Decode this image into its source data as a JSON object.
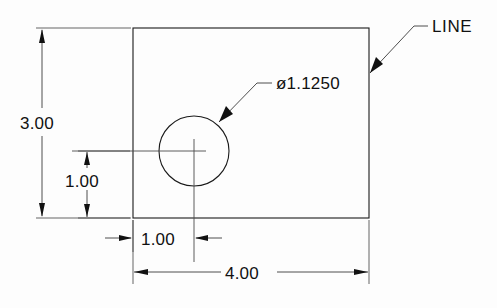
{
  "drawing": {
    "type": "engineering-dimensioned-part-drawing",
    "units": "inches",
    "background_color": "#fdfdfd",
    "line_color": "#1a1a1a",
    "text_color": "#111111",
    "part": {
      "shape": "rectangle-with-hole",
      "width": "4.00",
      "height": "3.00"
    },
    "dimensions": [
      {
        "name": "overall-height",
        "value": "3.00",
        "orientation": "vertical",
        "position": "left"
      },
      {
        "name": "hole-center-from-bottom",
        "value": "1.00",
        "orientation": "vertical",
        "position": "left-inner"
      },
      {
        "name": "hole-center-from-left",
        "value": "1.00",
        "orientation": "horizontal",
        "position": "bottom-inner"
      },
      {
        "name": "overall-width",
        "value": "4.00",
        "orientation": "horizontal",
        "position": "bottom"
      }
    ],
    "callouts": [
      {
        "name": "hole-diameter-callout",
        "symbol": "ø",
        "value": "1.1250",
        "text": "ø1.1250",
        "points_to": "circle-hole"
      },
      {
        "name": "line-callout",
        "text": "LINE",
        "points_to": "right-edge-of-rectangle"
      }
    ],
    "feature_labels": {
      "height_dim": "3.00",
      "hole_y_dim": "1.00",
      "hole_x_dim": "1.00",
      "width_dim": "4.00",
      "diameter_callout": "ø1.1250",
      "line_label": "LINE"
    }
  }
}
